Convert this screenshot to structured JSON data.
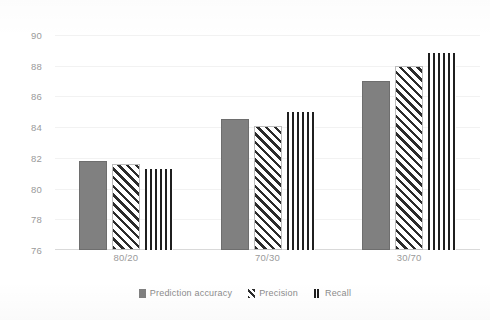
{
  "chart_data": {
    "type": "bar",
    "title": "",
    "xlabel": "",
    "ylabel": "",
    "categories": [
      "80/20",
      "70/30",
      "30/70"
    ],
    "series": [
      {
        "name": "Prediction accuracy",
        "pattern": "solid-gray",
        "values": [
          81.8,
          84.5,
          87.0
        ]
      },
      {
        "name": "Precision",
        "pattern": "diagonal-hatch",
        "values": [
          81.6,
          84.1,
          88.0
        ]
      },
      {
        "name": "Recall",
        "pattern": "vertical-stripes",
        "values": [
          81.3,
          85.0,
          88.8
        ]
      }
    ],
    "ylim": [
      76,
      90
    ],
    "yticks": [
      76,
      78,
      80,
      82,
      84,
      86,
      88,
      90
    ],
    "ytick_labels": [
      "76",
      "78",
      "80",
      "82",
      "84",
      "86",
      "88",
      "90"
    ],
    "grid": true,
    "legend_position": "bottom",
    "colors": {
      "series_1": "#808080",
      "series_2": "#2b2b2b",
      "series_3": "#1f1f1f",
      "gridline": "#f2f2f2",
      "axis": "#d9d9d9",
      "text": "#9a9a9a",
      "background": "#ffffff"
    }
  },
  "legend": {
    "items": [
      {
        "label": "Prediction accuracy"
      },
      {
        "label": "Precision"
      },
      {
        "label": "Recall"
      }
    ]
  },
  "top_strip": {
    "text": ""
  }
}
